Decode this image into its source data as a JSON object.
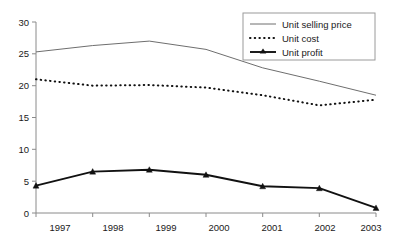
{
  "chart_data": {
    "type": "line",
    "title": "",
    "subtitle": "",
    "xlabel": "",
    "ylabel": "",
    "categories": [
      "1997",
      "1998",
      "1999",
      "2000",
      "2001",
      "2002",
      "2003"
    ],
    "x": [
      1997,
      1998,
      1999,
      2000,
      2001,
      2002,
      2003
    ],
    "ylim": [
      0,
      30
    ],
    "yticks": [
      0,
      5,
      10,
      15,
      20,
      25,
      30
    ],
    "ytick_labels": [
      "0",
      "5",
      "10",
      "15",
      "20",
      "25",
      "30"
    ],
    "grid": false,
    "legend_position": "top-right",
    "series": [
      {
        "name": "Unit selling price",
        "style": "solid-thin",
        "color": "#6e6e6e",
        "marker": "none",
        "values": [
          25.3,
          26.3,
          27.0,
          25.7,
          22.8,
          20.7,
          18.5
        ]
      },
      {
        "name": "Unit cost",
        "style": "dotted",
        "color": "#111111",
        "marker": "none",
        "values": [
          21.0,
          20.0,
          20.1,
          19.7,
          18.5,
          16.9,
          17.8
        ]
      },
      {
        "name": "Unit profit",
        "style": "solid-thick",
        "color": "#111111",
        "marker": "triangle",
        "values": [
          4.3,
          6.5,
          6.8,
          6.0,
          4.2,
          3.9,
          0.8
        ]
      }
    ]
  },
  "legend": {
    "entries": [
      {
        "label": "Unit selling price"
      },
      {
        "label": "Unit cost"
      },
      {
        "label": "Unit profit"
      }
    ]
  },
  "axes": {
    "y_tick_labels": [
      "30",
      "25",
      "20",
      "15",
      "10",
      "5",
      "0"
    ],
    "x_tick_labels": [
      "1997",
      "1998",
      "1999",
      "2000",
      "2001",
      "2002",
      "2003"
    ]
  }
}
